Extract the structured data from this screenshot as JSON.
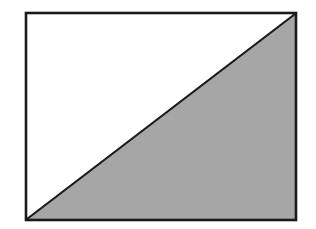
{
  "diagram": {
    "rectangle": {
      "x": 26,
      "y": 13,
      "width": 270,
      "height": 207
    },
    "diagonal": {
      "from": "bottom-left",
      "to": "top-right"
    },
    "colors": {
      "stroke": "#1a1a1a",
      "shaded_fill": "#a6a6a6",
      "unshaded_fill": "#ffffff"
    }
  }
}
